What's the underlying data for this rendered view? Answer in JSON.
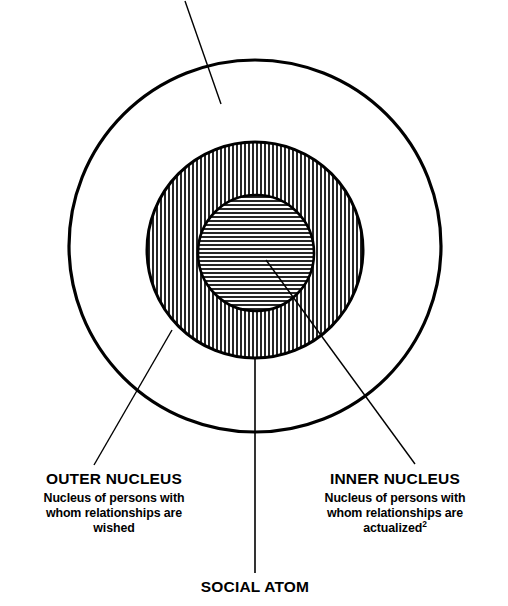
{
  "figure": {
    "background_color": "#ffffff",
    "stroke_color": "#000000"
  },
  "labels": {
    "outer_nucleus": {
      "heading": "OUTER NUCLEUS",
      "caption_line1": "Nucleus of persons with",
      "caption_line2": "whom relationships are",
      "caption_line3": "wished"
    },
    "inner_nucleus": {
      "heading": "INNER NUCLEUS",
      "caption_line1": "Nucleus of persons with",
      "caption_line2": "whom relationships are",
      "caption_line3": "actualized",
      "caption_superscript": "2"
    },
    "social_atom": {
      "heading": "SOCIAL ATOM"
    }
  },
  "shapes": {
    "outer_circle": {
      "name": "outer-circle",
      "cx": 255,
      "cy": 246,
      "r": 186,
      "fill": "none",
      "stroke_width": 3.2
    },
    "middle_circle": {
      "name": "middle-circle-vertical-hatch",
      "cx": 255,
      "cy": 250,
      "r": 108,
      "hatch": "vertical",
      "hatch_spacing": 4,
      "stroke_width": 3.0
    },
    "inner_circle": {
      "name": "inner-circle-horizontal-hatch",
      "cx": 256,
      "cy": 253,
      "r": 58,
      "hatch": "horizontal",
      "hatch_spacing": 4,
      "stroke_width": 2.6
    }
  },
  "leader_lines": {
    "top_pointer": {
      "x1": 185,
      "y1": 1,
      "x2": 221,
      "y2": 104
    },
    "outer_nucleus_pointer": {
      "x1": 172,
      "y1": 330,
      "x2": 94,
      "y2": 465
    },
    "inner_nucleus_pointer": {
      "x1": 266,
      "y1": 260,
      "x2": 415,
      "y2": 464
    },
    "social_atom_pointer": {
      "x1": 255,
      "y1": 358,
      "x2": 255,
      "y2": 573
    }
  }
}
